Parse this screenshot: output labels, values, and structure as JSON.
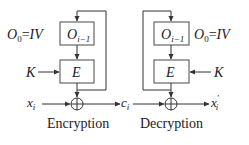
{
  "diagram": {
    "colors": {
      "line": "#333333",
      "box_stroke": "#555555",
      "text": "#1a1a1a",
      "background": "#ffffff"
    },
    "encryption": {
      "caption": "Encryption",
      "iv_label": {
        "O": "O",
        "sub": "0",
        "eq": "=",
        "iv": "IV"
      },
      "register_box": {
        "O": "O",
        "sub": "i−1"
      },
      "cipher_box": "E",
      "key_label": "K",
      "input_label": {
        "x": "x",
        "sub": "i"
      },
      "output_label": {
        "c": "c",
        "sub": "i"
      }
    },
    "decryption": {
      "caption": "Decryption",
      "iv_label": {
        "O": "O",
        "sub": "0",
        "eq": "=",
        "iv": "IV"
      },
      "register_box": {
        "O": "O",
        "sub": "i−1"
      },
      "cipher_box": "E",
      "key_label": "K",
      "output_label": {
        "x": "x",
        "prime": "′",
        "sub": "i"
      }
    },
    "nodes": [
      {
        "id": "enc-O",
        "type": "box",
        "label": "O_{i-1}"
      },
      {
        "id": "enc-E",
        "type": "box",
        "label": "E"
      },
      {
        "id": "enc-xor",
        "type": "xor"
      },
      {
        "id": "dec-O",
        "type": "box",
        "label": "O_{i-1}"
      },
      {
        "id": "dec-E",
        "type": "box",
        "label": "E"
      },
      {
        "id": "dec-xor",
        "type": "xor"
      }
    ],
    "edges": [
      {
        "from": "IV",
        "to": "enc-O"
      },
      {
        "from": "enc-O",
        "to": "enc-E"
      },
      {
        "from": "K",
        "to": "enc-E"
      },
      {
        "from": "enc-E",
        "to": "enc-xor"
      },
      {
        "from": "enc-E",
        "to": "enc-O",
        "label": "feedback"
      },
      {
        "from": "x_i",
        "to": "enc-xor"
      },
      {
        "from": "enc-xor",
        "to": "c_i"
      },
      {
        "from": "c_i",
        "to": "dec-xor"
      },
      {
        "from": "IV",
        "to": "dec-O"
      },
      {
        "from": "dec-O",
        "to": "dec-E"
      },
      {
        "from": "K",
        "to": "dec-E"
      },
      {
        "from": "dec-E",
        "to": "dec-xor"
      },
      {
        "from": "dec-E",
        "to": "dec-O",
        "label": "feedback"
      },
      {
        "from": "dec-xor",
        "to": "x'_i"
      }
    ]
  }
}
